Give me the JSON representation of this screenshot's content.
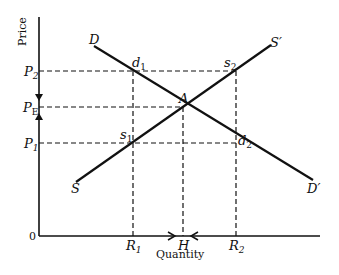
{
  "axes": {
    "y_label": "Price",
    "x_label": "Quantity",
    "origin": "0"
  },
  "price_levels": {
    "p2": "P",
    "p2_sub": "2",
    "pe": "P",
    "pe_sub": "E",
    "p1": "P",
    "p1_sub": "1"
  },
  "quantity_levels": {
    "r1": "R",
    "r1_sub": "1",
    "h": "H",
    "r2": "R",
    "r2_sub": "2"
  },
  "curves": {
    "demand_start": "D",
    "demand_end": "D′",
    "supply_start": "S",
    "supply_end": "S′"
  },
  "points": {
    "d1": "d",
    "d1_sub": "1",
    "s2": "s",
    "s2_sub": "2",
    "a": "A",
    "s1": "s",
    "s1_sub": "1",
    "d2": "d",
    "d2_sub": "2"
  },
  "colors": {
    "line": "#111111",
    "background": "#ffffff"
  }
}
